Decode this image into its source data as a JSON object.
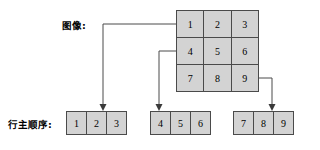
{
  "diagram": {
    "labels": {
      "image": "图像:",
      "row_major_order": "行主顺序:"
    },
    "matrix": {
      "rows": 3,
      "cols": 3,
      "cells": [
        "1",
        "2",
        "3",
        "4",
        "5",
        "6",
        "7",
        "8",
        "9"
      ]
    },
    "arrays": [
      {
        "name": "row-1",
        "cells": [
          "1",
          "2",
          "3"
        ]
      },
      {
        "name": "row-2",
        "cells": [
          "4",
          "5",
          "6"
        ]
      },
      {
        "name": "row-3",
        "cells": [
          "7",
          "8",
          "9"
        ]
      }
    ],
    "colors": {
      "cell_fill": "#d3d3d3",
      "stroke": "#4a4a4a",
      "background": "#ffffff",
      "text": "#000000"
    }
  }
}
